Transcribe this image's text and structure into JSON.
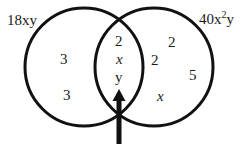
{
  "sets": [
    {
      "label": "18xy",
      "label_html_parts": [
        "18xy"
      ]
    },
    {
      "label_base": "40x",
      "label_sup": "2",
      "label_tail": "y"
    }
  ],
  "regions": {
    "left_only": [
      "3",
      "3"
    ],
    "intersection": [
      "2",
      "x",
      "y"
    ],
    "right_only": [
      "2",
      "2",
      "5",
      "x"
    ]
  },
  "pointer": "arrow pointing up at intersection"
}
